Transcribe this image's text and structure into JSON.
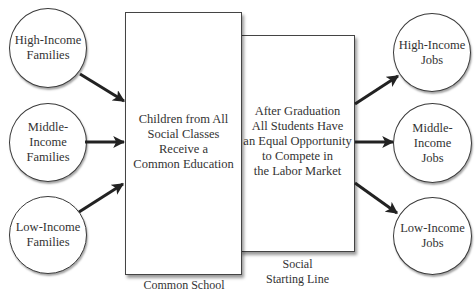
{
  "diagram": {
    "sources": [
      {
        "id": "high-income-families",
        "label": "High-Income\nFamilies"
      },
      {
        "id": "middle-income-families",
        "label": "Middle-\nIncome\nFamilies"
      },
      {
        "id": "low-income-families",
        "label": "Low-Income\nFamilies"
      }
    ],
    "stages": [
      {
        "id": "common-school",
        "text": "Children from All\nSocial Classes\nReceive a\nCommon Education",
        "caption": "Common School"
      },
      {
        "id": "social-starting-line",
        "text": "After Graduation\nAll Students Have\nan Equal Opportunity\nto Compete in\nthe Labor Market",
        "caption": "Social\nStarting Line"
      }
    ],
    "outcomes": [
      {
        "id": "high-income-jobs",
        "label": "High-Income\nJobs"
      },
      {
        "id": "middle-income-jobs",
        "label": "Middle-\nIncome\nJobs"
      },
      {
        "id": "low-income-jobs",
        "label": "Low-Income\nJobs"
      }
    ],
    "colors": {
      "line": "#222222",
      "box_border": "#444444",
      "background": "#ffffff"
    }
  }
}
